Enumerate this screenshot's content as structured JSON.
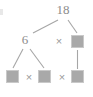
{
  "diagram": {
    "type": "factor-tree",
    "title": "",
    "root": {
      "label": "18",
      "x": 62,
      "y": 10
    },
    "level2": {
      "left_factor": {
        "label": "6",
        "x": 26,
        "y": 40
      },
      "operator": {
        "label": "×",
        "x": 59,
        "y": 41
      },
      "right_blank": {
        "label": "",
        "x": 77,
        "y": 41
      }
    },
    "level3": {
      "blank_1": {
        "label": "",
        "x": 12,
        "y": 77
      },
      "operator_1": {
        "label": "×",
        "x": 29,
        "y": 77
      },
      "blank_2": {
        "label": "",
        "x": 45,
        "y": 77
      },
      "operator_2": {
        "label": "×",
        "x": 62,
        "y": 77
      },
      "blank_3": {
        "label": "",
        "x": 77,
        "y": 77
      }
    },
    "colors": {
      "text": "#8c8c8c",
      "operator": "#9a9a9a",
      "box_fill": "#a9a9a9",
      "box_border": "#c9c9c9",
      "line": "#a0a0a0",
      "background": "#ffffff"
    },
    "edges": [
      {
        "from": "18",
        "to": "6"
      },
      {
        "from": "18",
        "to": "right_blank"
      },
      {
        "from": "6",
        "to": "blank_1"
      },
      {
        "from": "6",
        "to": "blank_2"
      },
      {
        "from": "right_blank",
        "to": "blank_3"
      }
    ]
  }
}
